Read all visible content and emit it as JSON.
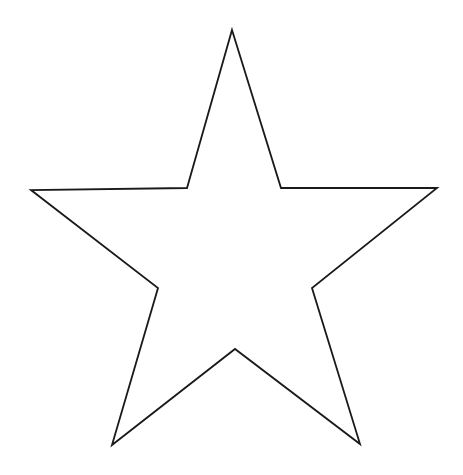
{
  "canvas": {
    "width": 463,
    "height": 475,
    "background": "#ffffff"
  },
  "shape": {
    "type": "five-pointed-star",
    "stroke": "#1a1a1a",
    "stroke_width": 1.8,
    "fill": "#ffffff",
    "points": "232,30 281,188 437,188 312,288 360,444 235,349 112,445 158,288 31,190 187,188"
  }
}
